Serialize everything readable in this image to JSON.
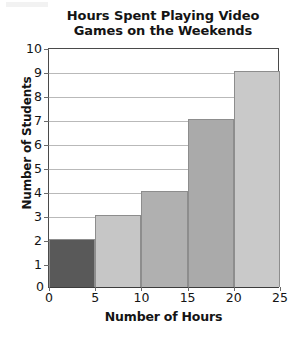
{
  "chart_data": {
    "type": "bar",
    "title": "Hours Spent Playing Video Games on the Weekends",
    "title_lines": [
      "Hours Spent Playing Video",
      "Games on the Weekends"
    ],
    "xlabel": "Number of Hours",
    "ylabel": "Number of Students",
    "categories": [
      "0-5",
      "5-10",
      "10-15",
      "15-20",
      "20-25"
    ],
    "values": [
      2,
      3,
      4,
      7,
      9
    ],
    "bin_edges": [
      0,
      5,
      10,
      15,
      20,
      25
    ],
    "bar_colors": [
      "#595959",
      "#c6c6c6",
      "#b0b0b0",
      "#aaaaaa",
      "#c9c9c9"
    ],
    "xlim": [
      0,
      25
    ],
    "ylim": [
      0,
      10
    ],
    "xticks": [
      0,
      5,
      10,
      15,
      20,
      25
    ],
    "yticks": [
      0,
      1,
      2,
      3,
      4,
      5,
      6,
      7,
      8,
      9,
      10
    ],
    "xtick_labels": [
      "0",
      "5",
      "10",
      "15",
      "20",
      "25"
    ],
    "ytick_labels": [
      "0",
      "1",
      "2",
      "3",
      "4",
      "5",
      "6",
      "7",
      "8",
      "9",
      "10"
    ],
    "grid": "horizontal",
    "legend": null,
    "bars": [
      {
        "label": "0-5",
        "value": 2,
        "color": "#595959"
      },
      {
        "label": "5-10",
        "value": 3,
        "color": "#c6c6c6"
      },
      {
        "label": "10-15",
        "value": 4,
        "color": "#b0b0b0"
      },
      {
        "label": "15-20",
        "value": 7,
        "color": "#aaaaaa"
      },
      {
        "label": "20-25",
        "value": 9,
        "color": "#c9c9c9"
      }
    ]
  },
  "colors": {
    "background": "#ffffff",
    "axis": "#4a4a4a",
    "gridline": "#b9b9b9",
    "text": "#141414"
  }
}
